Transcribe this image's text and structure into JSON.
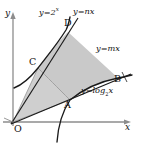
{
  "figure": {
    "width": 142,
    "height": 146,
    "background_color": "#ffffff",
    "shade_color": "#c9c9c9",
    "shade_color_light": "#d8d8d8",
    "stroke_color": "#1a1a1a",
    "axis_color": "#7a7a7a"
  },
  "axes": {
    "x_label": "x",
    "y_label": "y",
    "origin_label": "O"
  },
  "curves": [
    {
      "name": "exponential",
      "label_y": "y",
      "label_eq": "=2",
      "label_exp": "x",
      "label_full": "y=2ˣ"
    },
    {
      "name": "logarithmic",
      "label_y": "y",
      "label_eq": "=log",
      "label_base": "2",
      "label_arg": "x",
      "label_full": "y=log₂x"
    }
  ],
  "lines": [
    {
      "name": "line-n",
      "label_y": "y",
      "label_eq": "=nx",
      "label_full": "y=nx"
    },
    {
      "name": "line-m",
      "label_y": "y",
      "label_eq": "=mx",
      "label_full": "y=mx"
    }
  ],
  "points": [
    {
      "id": "A",
      "label": "A",
      "x": 70,
      "y": 100
    },
    {
      "id": "B",
      "label": "B",
      "x": 118,
      "y": 78
    },
    {
      "id": "C",
      "label": "C",
      "x": 38,
      "y": 68
    },
    {
      "id": "D",
      "label": "D",
      "x": 68,
      "y": 32
    }
  ],
  "labels": {
    "exp_curve": "y=2",
    "exp_curve_sup": "x",
    "line_n": "y=nx",
    "line_m": "y=mx",
    "log_curve_pre": "y=log",
    "log_curve_sub": "2",
    "log_curve_post": "x",
    "point_a": "A",
    "point_b": "B",
    "point_c": "C",
    "point_d": "D",
    "origin": "O",
    "axis_x": "x",
    "axis_y": "y"
  }
}
